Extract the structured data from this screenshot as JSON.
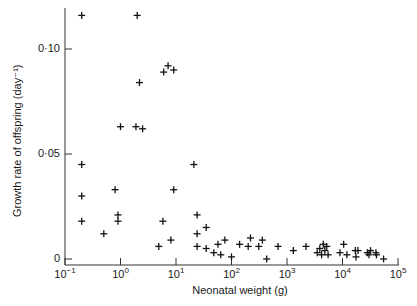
{
  "chart_data": {
    "type": "scatter",
    "title": "",
    "xlabel": "Neonatal weight (g)",
    "ylabel": "Growth rate of offspring (day⁻¹)",
    "xscale": "log",
    "xlim": [
      0.1,
      100000
    ],
    "ylim": [
      0,
      0.12
    ],
    "grid": false,
    "legend": null,
    "marker": "+",
    "x_ticks": [
      {
        "value": 0.1,
        "label": "10",
        "exp": "−1"
      },
      {
        "value": 1,
        "label": "10",
        "exp": "0"
      },
      {
        "value": 10,
        "label": "10",
        "exp": "1"
      },
      {
        "value": 100,
        "label": "10",
        "exp": "2"
      },
      {
        "value": 1000,
        "label": "10",
        "exp": "3"
      },
      {
        "value": 10000,
        "label": "10",
        "exp": "4"
      },
      {
        "value": 100000,
        "label": "10",
        "exp": "5"
      }
    ],
    "y_ticks": [
      {
        "value": 0,
        "label": "0"
      },
      {
        "value": 0.05,
        "label": "0·05"
      },
      {
        "value": 0.1,
        "label": "0·10"
      }
    ],
    "series": [
      {
        "name": "species",
        "points": [
          [
            0.2,
            0.116
          ],
          [
            2.0,
            0.116
          ],
          [
            2.2,
            0.084
          ],
          [
            6.0,
            0.089
          ],
          [
            7.2,
            0.092
          ],
          [
            9.1,
            0.09
          ],
          [
            1.0,
            0.063
          ],
          [
            1.9,
            0.063
          ],
          [
            2.5,
            0.062
          ],
          [
            0.2,
            0.045
          ],
          [
            21,
            0.045
          ],
          [
            0.2,
            0.03
          ],
          [
            0.8,
            0.033
          ],
          [
            9.1,
            0.033
          ],
          [
            0.2,
            0.018
          ],
          [
            0.5,
            0.012
          ],
          [
            0.9,
            0.021
          ],
          [
            0.9,
            0.018
          ],
          [
            5.8,
            0.018
          ],
          [
            8.1,
            0.009
          ],
          [
            4.9,
            0.006
          ],
          [
            24,
            0.021
          ],
          [
            24,
            0.012
          ],
          [
            35,
            0.015
          ],
          [
            24,
            0.006
          ],
          [
            35,
            0.005
          ],
          [
            48,
            0.003
          ],
          [
            57,
            0.007
          ],
          [
            64,
            0.002
          ],
          [
            76,
            0.009
          ],
          [
            100,
            0.001
          ],
          [
            140,
            0.007
          ],
          [
            200,
            0.006
          ],
          [
            220,
            0.01
          ],
          [
            310,
            0.006
          ],
          [
            360,
            0.009
          ],
          [
            430,
            0.0
          ],
          [
            690,
            0.006
          ],
          [
            1300,
            0.004
          ],
          [
            2200,
            0.006
          ],
          [
            3500,
            0.003
          ],
          [
            3900,
            0.005
          ],
          [
            4200,
            0.002
          ],
          [
            4500,
            0.007
          ],
          [
            4800,
            0.004
          ],
          [
            5200,
            0.006
          ],
          [
            5500,
            0.002
          ],
          [
            9000,
            0.003
          ],
          [
            10500,
            0.007
          ],
          [
            12000,
            0.002
          ],
          [
            17000,
            0.004
          ],
          [
            17500,
            0.001
          ],
          [
            19000,
            0.004
          ],
          [
            28000,
            0.003
          ],
          [
            30000,
            0.002
          ],
          [
            32000,
            0.004
          ],
          [
            40000,
            0.003
          ],
          [
            41000,
            0.002
          ],
          [
            55000,
            0.0
          ]
        ]
      }
    ]
  }
}
